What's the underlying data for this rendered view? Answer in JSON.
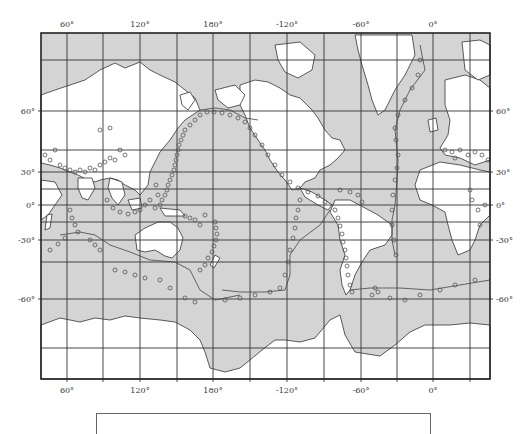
{
  "map": {
    "type": "world-seismicity-map",
    "projection": "Mercator",
    "colors": {
      "ocean": "#d4d4d4",
      "land": "#ffffff",
      "grid": "#333333",
      "frame": "#222222",
      "event_marker": "#555555",
      "plate_boundary": "#444444"
    },
    "top_axis_labels": [
      "60°",
      "120°",
      "180°",
      "-120°",
      "-60°",
      "0°"
    ],
    "bottom_axis_labels": [
      "60°",
      "120°",
      "180°",
      "-120°",
      "-60°",
      "0°"
    ],
    "left_axis_labels": [
      "60°",
      "30°",
      "0°",
      "-30°",
      "-60°"
    ],
    "right_axis_labels": [
      "60°",
      "30°",
      "0°",
      "-30°",
      "-60°"
    ],
    "gridline_spacing_deg": 30,
    "longitude_range": "approx 30°E to 45°E (wrapping through 180°)",
    "marker_symbol": "open circle",
    "legend": {
      "visible_text": ""
    }
  }
}
